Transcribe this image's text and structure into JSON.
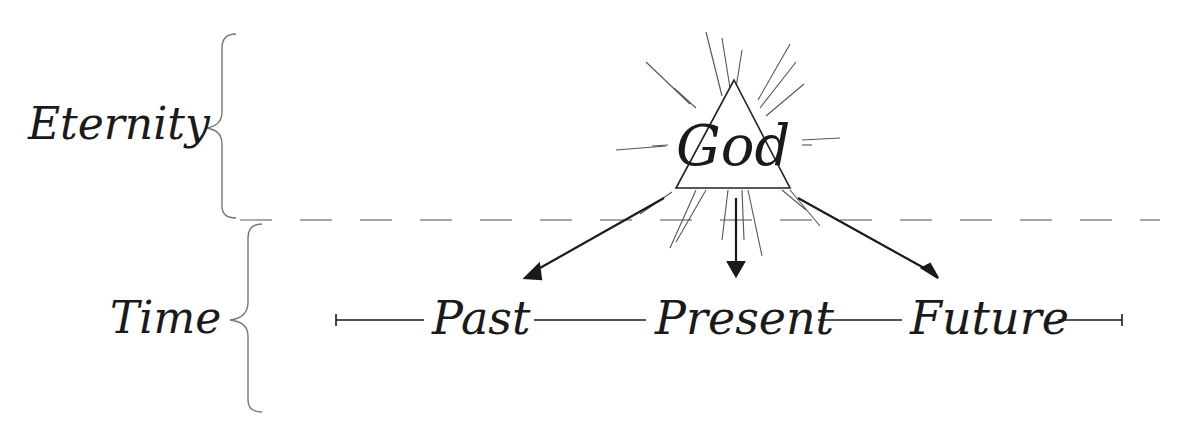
{
  "diagram": {
    "realms": {
      "eternity": "Eternity",
      "time": "Time"
    },
    "center": "God",
    "timeline": [
      "Past",
      "Present",
      "Future"
    ],
    "colors": {
      "ink": "#1a1a1a",
      "rays": "#555555",
      "divider": "#888888",
      "background": "#ffffff"
    }
  }
}
